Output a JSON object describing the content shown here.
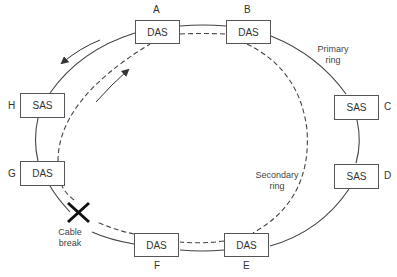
{
  "diagram": {
    "type": "FDDI dual ring with cable break",
    "colors": {
      "line": "#444444",
      "box_border": "#555555",
      "text": "#333333"
    },
    "nodes": [
      {
        "id": "A",
        "kind": "DAS"
      },
      {
        "id": "B",
        "kind": "DAS"
      },
      {
        "id": "C",
        "kind": "SAS"
      },
      {
        "id": "D",
        "kind": "SAS"
      },
      {
        "id": "E",
        "kind": "DAS"
      },
      {
        "id": "F",
        "kind": "DAS"
      },
      {
        "id": "G",
        "kind": "DAS"
      },
      {
        "id": "H",
        "kind": "SAS"
      }
    ],
    "annotations": {
      "primary_ring_line1": "Primary",
      "primary_ring_line2": "ring",
      "secondary_ring_line1": "Secondary",
      "secondary_ring_line2": "ring",
      "cable_break_line1": "Cable",
      "cable_break_line2": "break"
    },
    "legend": {
      "primary_ring": "solid line, counter-clockwise flow",
      "secondary_ring": "dashed line, clockwise flow"
    }
  }
}
